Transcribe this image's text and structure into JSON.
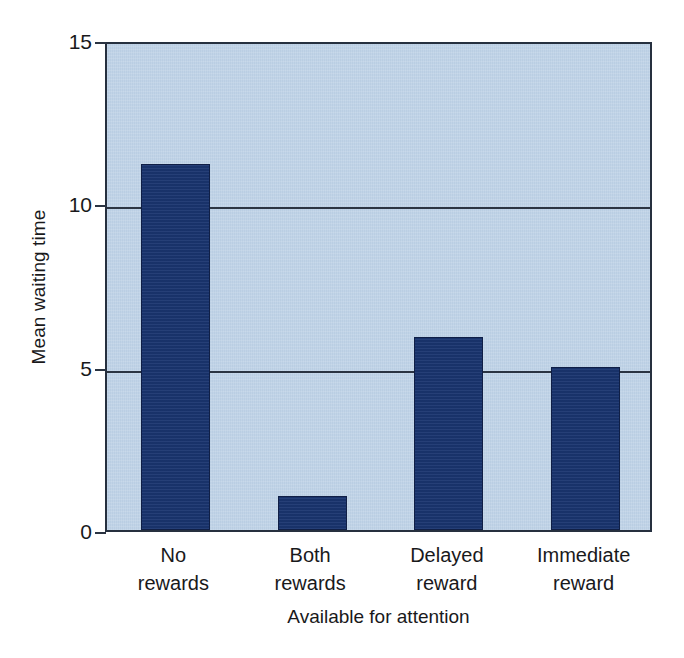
{
  "chart_data": {
    "type": "bar",
    "title": "",
    "xlabel": "Available for attention",
    "ylabel": "Mean waiting time",
    "categories": [
      "No rewards",
      "Both rewards",
      "Delayed reward",
      "Immediate reward"
    ],
    "category_lines": [
      [
        "No",
        "rewards"
      ],
      [
        "Both",
        "rewards"
      ],
      [
        "Delayed",
        "reward"
      ],
      [
        "Immediate",
        "reward"
      ]
    ],
    "values": [
      11.2,
      1.05,
      5.9,
      5.0
    ],
    "ylim": [
      0,
      15
    ],
    "yticks": [
      0,
      5,
      10,
      15
    ],
    "ytick_labels": [
      "0",
      "5",
      "10",
      "15"
    ],
    "grid": "horizontal",
    "legend": "none",
    "colors": {
      "bar_fill": "#1a3570",
      "bar_edge": "#101f46",
      "panel_background": "#bdd1e6",
      "axis_line": "#26303f",
      "gridline": "#2b3442",
      "text": "#19191b",
      "figure_background": "#ffffff"
    }
  }
}
